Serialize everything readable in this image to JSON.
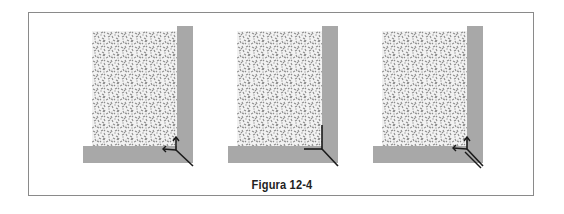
{
  "figure": {
    "caption": "Figura 12-4",
    "colors": {
      "border": "#8a8a8a",
      "wall": "#a8a8a8",
      "gravel_dots": "#8c8c8c",
      "line": "#1a1a1a"
    },
    "panels": [
      {
        "id": "panel-1",
        "x": 54,
        "line_style": "arrow-up-and-left"
      },
      {
        "id": "panel-2",
        "x": 199,
        "line_style": "corner-lines"
      },
      {
        "id": "panel-3",
        "x": 344,
        "line_style": "arrow-up-and-left-double"
      }
    ]
  }
}
